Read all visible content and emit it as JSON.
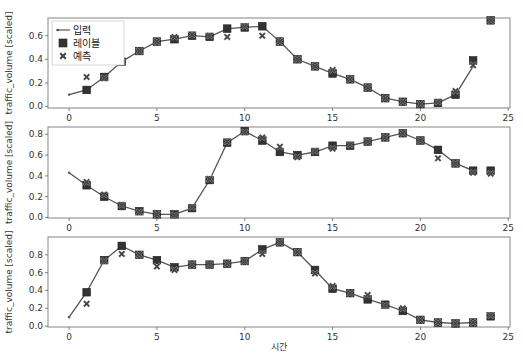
{
  "figure": {
    "xlabel": "시간",
    "ylabel": "traffic_volume [scaled]",
    "legend": {
      "input_label": "입력",
      "label_label": "레이블",
      "prediction_label": "예측"
    },
    "colors": {
      "input_line": "#555555",
      "label_marker": "#333333",
      "prediction_marker": "#444444",
      "frame": "#999999"
    }
  },
  "chart_data": [
    {
      "type": "line",
      "panel": 1,
      "xlabel": "",
      "ylabel": "traffic_volume [scaled]",
      "xlim": [
        -1.2,
        25.1
      ],
      "ylim": [
        -0.013,
        0.75
      ],
      "xticks": [
        0,
        5,
        10,
        15,
        20,
        25
      ],
      "yticks": [
        0.0,
        0.2,
        0.4,
        0.6
      ],
      "legend": [
        "입력",
        "레이블",
        "예측"
      ],
      "legend_position": "upper left",
      "grid": false,
      "series": [
        {
          "name": "입력",
          "x": [
            0,
            1,
            2,
            3,
            4,
            5,
            6,
            7,
            8,
            9,
            10,
            11,
            12,
            13,
            14,
            15,
            16,
            17,
            18,
            19,
            20,
            21,
            22,
            23
          ],
          "values": [
            0.1,
            0.14,
            0.25,
            0.38,
            0.47,
            0.55,
            0.57,
            0.6,
            0.59,
            0.66,
            0.67,
            0.68,
            0.55,
            0.4,
            0.34,
            0.28,
            0.23,
            0.16,
            0.07,
            0.04,
            0.02,
            0.03,
            0.1,
            0.34
          ]
        },
        {
          "name": "레이블",
          "x": [
            1,
            2,
            3,
            4,
            5,
            6,
            7,
            8,
            9,
            10,
            11,
            12,
            13,
            14,
            15,
            16,
            17,
            18,
            19,
            20,
            21,
            22,
            23,
            24
          ],
          "values": [
            0.14,
            0.25,
            0.38,
            0.47,
            0.55,
            0.57,
            0.6,
            0.59,
            0.66,
            0.67,
            0.68,
            0.55,
            0.4,
            0.34,
            0.28,
            0.23,
            0.16,
            0.07,
            0.04,
            0.02,
            0.03,
            0.1,
            0.39,
            0.73
          ]
        },
        {
          "name": "예측",
          "x": [
            1,
            2,
            3,
            4,
            5,
            6,
            7,
            8,
            9,
            10,
            11,
            12,
            13,
            14,
            15,
            16,
            17,
            18,
            19,
            20,
            21,
            22,
            23,
            24
          ],
          "values": [
            0.25,
            0.24,
            0.38,
            0.47,
            0.55,
            0.59,
            0.61,
            0.6,
            0.59,
            0.68,
            0.6,
            0.55,
            0.4,
            0.34,
            0.31,
            0.23,
            0.16,
            0.07,
            0.04,
            0.02,
            0.04,
            0.13,
            0.35,
            0.73
          ]
        }
      ]
    },
    {
      "type": "line",
      "panel": 2,
      "xlabel": "",
      "ylabel": "traffic_volume [scaled]",
      "xlim": [
        -1.2,
        25.1
      ],
      "ylim": [
        -0.005,
        0.87
      ],
      "xticks": [
        0,
        5,
        10,
        15,
        20,
        25
      ],
      "yticks": [
        0.0,
        0.2,
        0.4,
        0.6,
        0.8
      ],
      "grid": false,
      "series": [
        {
          "name": "입력",
          "x": [
            0,
            1,
            2,
            3,
            4,
            5,
            6,
            7,
            8,
            9,
            10,
            11,
            12,
            13,
            14,
            15,
            16,
            17,
            18,
            19,
            20,
            21,
            22,
            23
          ],
          "values": [
            0.43,
            0.31,
            0.2,
            0.11,
            0.06,
            0.03,
            0.03,
            0.09,
            0.36,
            0.72,
            0.83,
            0.74,
            0.63,
            0.6,
            0.63,
            0.69,
            0.69,
            0.73,
            0.77,
            0.81,
            0.74,
            0.65,
            0.52,
            0.45
          ]
        },
        {
          "name": "레이블",
          "x": [
            1,
            2,
            3,
            4,
            5,
            6,
            7,
            8,
            9,
            10,
            11,
            12,
            13,
            14,
            15,
            16,
            17,
            18,
            19,
            20,
            21,
            22,
            23,
            24
          ],
          "values": [
            0.31,
            0.2,
            0.11,
            0.06,
            0.03,
            0.03,
            0.09,
            0.36,
            0.72,
            0.83,
            0.74,
            0.63,
            0.6,
            0.63,
            0.69,
            0.69,
            0.73,
            0.77,
            0.81,
            0.74,
            0.65,
            0.52,
            0.45,
            0.45
          ]
        },
        {
          "name": "예측",
          "x": [
            1,
            2,
            3,
            4,
            5,
            6,
            7,
            8,
            9,
            10,
            11,
            12,
            13,
            14,
            15,
            16,
            17,
            18,
            19,
            20,
            21,
            22,
            23,
            24
          ],
          "values": [
            0.34,
            0.22,
            0.12,
            0.05,
            0.03,
            0.02,
            0.1,
            0.37,
            0.73,
            0.82,
            0.77,
            0.68,
            0.58,
            0.64,
            0.66,
            0.7,
            0.73,
            0.77,
            0.81,
            0.74,
            0.57,
            0.52,
            0.43,
            0.42
          ]
        }
      ]
    },
    {
      "type": "line",
      "panel": 3,
      "xlabel": "시간",
      "ylabel": "traffic_volume [scaled]",
      "xlim": [
        -1.2,
        25.1
      ],
      "ylim": [
        -0.01,
        1.0
      ],
      "xticks": [
        0,
        5,
        10,
        15,
        20,
        25
      ],
      "yticks": [
        0.0,
        0.2,
        0.4,
        0.6,
        0.8
      ],
      "grid": false,
      "series": [
        {
          "name": "입력",
          "x": [
            0,
            1,
            2,
            3,
            4,
            5,
            6,
            7,
            8,
            9,
            10,
            11,
            12,
            13,
            14,
            15,
            16,
            17,
            18,
            19,
            20,
            21,
            22,
            23
          ],
          "values": [
            0.1,
            0.38,
            0.74,
            0.9,
            0.8,
            0.74,
            0.66,
            0.69,
            0.69,
            0.7,
            0.73,
            0.86,
            0.94,
            0.83,
            0.63,
            0.42,
            0.37,
            0.3,
            0.24,
            0.17,
            0.07,
            0.04,
            0.03,
            0.04
          ]
        },
        {
          "name": "레이블",
          "x": [
            1,
            2,
            3,
            4,
            5,
            6,
            7,
            8,
            9,
            10,
            11,
            12,
            13,
            14,
            15,
            16,
            17,
            18,
            19,
            20,
            21,
            22,
            23,
            24
          ],
          "values": [
            0.38,
            0.74,
            0.9,
            0.8,
            0.74,
            0.66,
            0.69,
            0.69,
            0.7,
            0.73,
            0.86,
            0.94,
            0.83,
            0.63,
            0.42,
            0.37,
            0.3,
            0.24,
            0.17,
            0.07,
            0.04,
            0.03,
            0.04,
            0.11
          ]
        },
        {
          "name": "예측",
          "x": [
            1,
            2,
            3,
            4,
            5,
            6,
            7,
            8,
            9,
            10,
            11,
            12,
            13,
            14,
            15,
            16,
            17,
            18,
            19,
            20,
            21,
            22,
            23,
            24
          ],
          "values": [
            0.25,
            0.73,
            0.81,
            0.8,
            0.67,
            0.63,
            0.69,
            0.69,
            0.7,
            0.73,
            0.81,
            0.94,
            0.83,
            0.59,
            0.45,
            0.37,
            0.35,
            0.23,
            0.2,
            0.07,
            0.04,
            0.03,
            0.04,
            0.12
          ]
        }
      ]
    }
  ]
}
